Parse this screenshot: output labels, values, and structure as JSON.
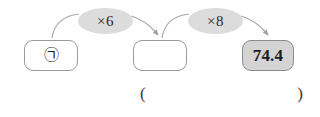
{
  "diagram": {
    "type": "function-machine-flow",
    "boxes": [
      {
        "id": "input",
        "label": "㉠",
        "kind": "symbol-unknown",
        "fill": "white"
      },
      {
        "id": "middle",
        "label": "",
        "kind": "empty-blank",
        "fill": "white"
      },
      {
        "id": "output",
        "label": "74.4",
        "kind": "value",
        "fill": "gray"
      }
    ],
    "operators": [
      {
        "id": "op1",
        "label": "×6"
      },
      {
        "id": "op2",
        "label": "×8"
      }
    ],
    "answer": {
      "open_paren": "(",
      "value": "",
      "close_paren": ")"
    }
  },
  "colors": {
    "box_border": "#9a9a9a",
    "box_fill": "#ffffff",
    "filled_box_fill": "#d4d4d4",
    "ellipse_fill": "#dcdcdc",
    "arrow": "#a8a8a8",
    "text": "#1c1c1c",
    "background": "#ffffff"
  }
}
